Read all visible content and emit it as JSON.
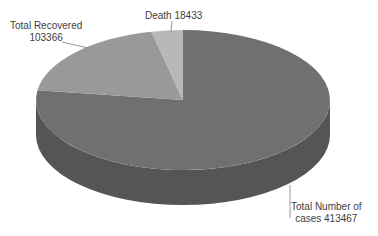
{
  "chart_data": {
    "type": "pie",
    "style": "3d",
    "title": "",
    "categories": [
      "Total Number of cases",
      "Total Recovered",
      "Death"
    ],
    "values": [
      413467,
      103366,
      18433
    ],
    "colors": [
      "#707070",
      "#999999",
      "#b8b8b8"
    ],
    "side_color": "#555555",
    "labels": [
      {
        "line1": "Total Number of",
        "line2": "cases 413467"
      },
      {
        "line1": "Total Recovered",
        "line2": "103366"
      },
      {
        "line1": "Death 18433",
        "line2": ""
      }
    ],
    "legend": "none"
  }
}
